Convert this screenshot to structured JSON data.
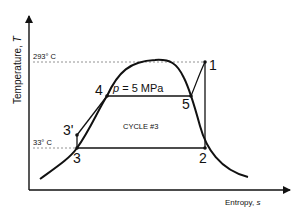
{
  "diagram": {
    "type": "T-s diagram (Rankine cycle)",
    "y_axis_label": "Temperature, ",
    "y_axis_symbol": "T",
    "x_axis_label": "Entropy, ",
    "x_axis_symbol": "s",
    "pressure_label_symbol": "p",
    "pressure_label_value": " = 5 MPa",
    "cycle_label": "CYCLE #3",
    "temperature_marks": [
      {
        "label": "293° C",
        "y": 62
      },
      {
        "label": "33° C",
        "y": 148
      }
    ],
    "points": [
      {
        "id": "1",
        "label": "1",
        "x": 205,
        "y": 62
      },
      {
        "id": "2",
        "label": "2",
        "x": 205,
        "y": 148
      },
      {
        "id": "3",
        "label": "3",
        "x": 77,
        "y": 148
      },
      {
        "id": "3p",
        "label": "3'",
        "x": 77,
        "y": 135
      },
      {
        "id": "4",
        "label": "4",
        "x": 107,
        "y": 96
      },
      {
        "id": "5",
        "label": "5",
        "x": 191,
        "y": 96
      }
    ],
    "colors": {
      "line": "#111111",
      "dashed": "#777777",
      "background": "#ffffff"
    }
  }
}
